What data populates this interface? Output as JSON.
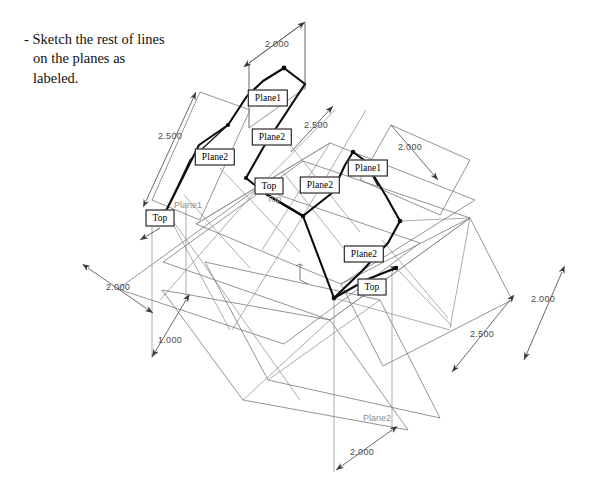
{
  "page": {
    "width": 595,
    "height": 498,
    "background": "#ffffff"
  },
  "instruction": {
    "text": "- Sketch the rest of lines\non the planes as\nlabeled."
  },
  "colors": {
    "ink": "#000000",
    "construction_line": "#6e6e6e",
    "dimension_line": "#545454",
    "ghost_text": "#8d8d8d",
    "callout_border": "#000000",
    "callout_fill": "#ffffff"
  },
  "callouts": [
    {
      "id": "c1",
      "label": "Plane1",
      "x": 268,
      "y": 98
    },
    {
      "id": "c2",
      "label": "Plane2",
      "x": 272,
      "y": 137
    },
    {
      "id": "c3",
      "label": "Plane2",
      "x": 215,
      "y": 157
    },
    {
      "id": "c4",
      "label": "Top",
      "x": 269,
      "y": 186
    },
    {
      "id": "c5",
      "label": "Plane2",
      "x": 320,
      "y": 185
    },
    {
      "id": "c6",
      "label": "Plane1",
      "x": 368,
      "y": 168
    },
    {
      "id": "c7",
      "label": "Top",
      "x": 160,
      "y": 218
    },
    {
      "id": "c8",
      "label": "Plane2",
      "x": 364,
      "y": 254
    },
    {
      "id": "c9",
      "label": "Top",
      "x": 372,
      "y": 287
    }
  ],
  "ghost_labels": [
    {
      "id": "g1",
      "label": "Plane1",
      "x": 188,
      "y": 205
    },
    {
      "id": "g2",
      "label": "Top",
      "x": 274,
      "y": 199
    },
    {
      "id": "g3",
      "label": "Plane2",
      "x": 377,
      "y": 418
    }
  ],
  "dimensions": [
    {
      "id": "d-top",
      "value": "2.000",
      "x": 277,
      "y": 44,
      "from": [
        249,
        63
      ],
      "to": [
        305,
        22
      ]
    },
    {
      "id": "d-left-upper",
      "value": "2.500",
      "x": 170,
      "y": 136,
      "x2": 0,
      "from": [
        146,
        201
      ],
      "to": [
        196,
        92
      ]
    },
    {
      "id": "d-mid-upper",
      "value": "2.500",
      "x": 316,
      "y": 125,
      "from": [
        291,
        150
      ],
      "to": [
        331,
        108
      ]
    },
    {
      "id": "d-right-upper",
      "value": "2.000",
      "x": 410,
      "y": 147,
      "from": [
        391,
        125
      ],
      "to": [
        438,
        178
      ]
    },
    {
      "id": "d-left-lower",
      "value": "2.000",
      "x": 118,
      "y": 287,
      "from": [
        89,
        268
      ],
      "to": [
        152,
        312
      ]
    },
    {
      "id": "d-left-bottom",
      "value": "1.000",
      "x": 170,
      "y": 340,
      "from": [
        186,
        300
      ],
      "to": [
        152,
        356
      ]
    },
    {
      "id": "d-right-lower",
      "value": "2.000",
      "x": 543,
      "y": 299,
      "from": [
        562,
        272
      ],
      "to": [
        525,
        360
      ]
    },
    {
      "id": "d-right-mid",
      "value": "2.500",
      "x": 482,
      "y": 334,
      "from": [
        510,
        300
      ],
      "to": [
        452,
        372
      ]
    },
    {
      "id": "d-bottom",
      "value": "2.000",
      "x": 362,
      "y": 452,
      "from": [
        392,
        430
      ],
      "to": [
        336,
        470
      ]
    }
  ],
  "geometry": {
    "description": "Isometric drawing with three large overlapping construction planes, dimension lines with arrowheads, and a bold zig-zag polyline representing the sketched object edges.",
    "bold_polyline": [
      [
        166,
        211
      ],
      [
        199,
        145
      ],
      [
        228,
        125
      ],
      [
        247,
        96
      ],
      [
        263,
        81
      ],
      [
        284,
        68
      ],
      [
        305,
        84
      ],
      [
        263,
        148
      ],
      [
        246,
        178
      ],
      [
        266,
        194
      ],
      [
        303,
        216
      ],
      [
        332,
        193
      ],
      [
        345,
        165
      ],
      [
        353,
        152
      ],
      [
        364,
        160
      ],
      [
        386,
        196
      ],
      [
        400,
        221
      ],
      [
        388,
        243
      ],
      [
        362,
        271
      ],
      [
        334,
        298
      ],
      [
        368,
        279
      ],
      [
        396,
        268
      ]
    ],
    "vertex_dots": [
      [
        166,
        211
      ],
      [
        228,
        125
      ],
      [
        284,
        68
      ],
      [
        246,
        178
      ],
      [
        303,
        216
      ],
      [
        353,
        152
      ],
      [
        400,
        221
      ],
      [
        334,
        298
      ],
      [
        396,
        268
      ]
    ],
    "plane_a": [
      [
        118,
        289
      ],
      [
        258,
        188
      ],
      [
        420,
        243
      ],
      [
        284,
        344
      ]
    ],
    "plane_b": [
      [
        196,
        224
      ],
      [
        330,
        143
      ],
      [
        475,
        200
      ],
      [
        341,
        284
      ]
    ],
    "plane_c": [
      [
        163,
        262
      ],
      [
        303,
        161
      ],
      [
        470,
        218
      ],
      [
        330,
        320
      ]
    ]
  },
  "axis_marker": {
    "label": "",
    "x": 300,
    "y": 272
  }
}
